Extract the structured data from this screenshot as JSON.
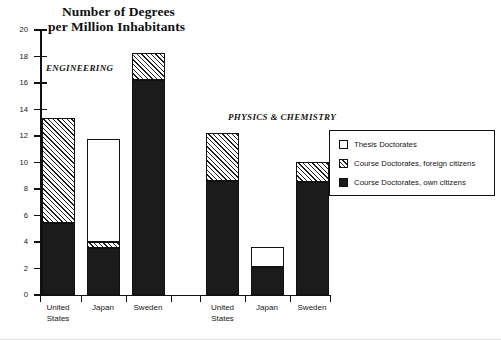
{
  "chart_data": {
    "type": "bar",
    "title": "Number of Degrees per Million Inhabitants",
    "title_line1": "Number of Degrees",
    "title_line2": "per Million Inhabitants",
    "xlabel": "",
    "ylabel": "",
    "ylim": [
      0,
      20
    ],
    "ytick_step": 2,
    "yticks": [
      20,
      18,
      16,
      14,
      12,
      10,
      8,
      6,
      4,
      2,
      0
    ],
    "grid": false,
    "legend_position": "right",
    "stacked": true,
    "group_captions": [
      "ENGINEERING",
      "PHYSICS & CHEMISTRY"
    ],
    "categories": [
      "United States",
      "Japan",
      "Sweden",
      "United States",
      "Japan",
      "Sweden"
    ],
    "category_lines": [
      [
        "United",
        "States"
      ],
      [
        "Japan",
        ""
      ],
      [
        "Sweden",
        ""
      ],
      [
        "United",
        "States"
      ],
      [
        "Japan",
        ""
      ],
      [
        "Sweden",
        ""
      ]
    ],
    "series": [
      {
        "name": "Course Doctorates, own citizens",
        "key": "own",
        "fill": "solid-black",
        "color": "#1b1b1b",
        "values": [
          5.4,
          3.5,
          16.2,
          8.6,
          2.1,
          8.5
        ]
      },
      {
        "name": "Course Doctorates, foreign citizens",
        "key": "foreign",
        "fill": "diagonal-hatch",
        "color": "#1f1f1f",
        "values": [
          7.9,
          0.5,
          2.0,
          3.6,
          0.0,
          1.5
        ]
      },
      {
        "name": "Thesis Doctorates",
        "key": "thesis",
        "fill": "white",
        "color": "#ffffff",
        "values": [
          0.0,
          7.7,
          0.0,
          0.0,
          1.5,
          0.0
        ]
      }
    ],
    "totals": [
      13.3,
      11.7,
      18.2,
      12.2,
      3.6,
      10.0
    ],
    "groups": [
      {
        "caption": "ENGINEERING",
        "bars": [
          {
            "category": "United States",
            "own": 5.4,
            "foreign": 7.9,
            "thesis": 0.0,
            "total": 13.3
          },
          {
            "category": "Japan",
            "own": 3.5,
            "foreign": 0.5,
            "thesis": 7.7,
            "total": 11.7
          },
          {
            "category": "Sweden",
            "own": 16.2,
            "foreign": 2.0,
            "thesis": 0.0,
            "total": 18.2
          }
        ]
      },
      {
        "caption": "PHYSICS & CHEMISTRY",
        "bars": [
          {
            "category": "United States",
            "own": 8.6,
            "foreign": 3.6,
            "thesis": 0.0,
            "total": 12.2
          },
          {
            "category": "Japan",
            "own": 2.1,
            "foreign": 0.0,
            "thesis": 1.5,
            "total": 3.6
          },
          {
            "category": "Sweden",
            "own": 8.5,
            "foreign": 1.5,
            "thesis": 0.0,
            "total": 10.0
          }
        ]
      }
    ],
    "legend": [
      {
        "label": "Thesis Doctorates",
        "swatch": "white"
      },
      {
        "label": "Course Doctorates, foreign citizens",
        "swatch": "diagonal-hatch"
      },
      {
        "label": "Course Doctorates, own citizens",
        "swatch": "solid-black"
      }
    ]
  }
}
